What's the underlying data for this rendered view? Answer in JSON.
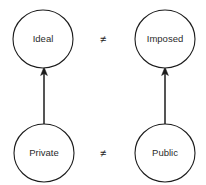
{
  "diagram": {
    "type": "node-edge-diagram",
    "background_color": "#ffffff",
    "stroke_color": "#1c1c1c",
    "text_color": "#2b2b2b",
    "nodes": [
      {
        "id": "ideal",
        "label": "Ideal",
        "cx": 43,
        "cy": 39,
        "rx": 30,
        "ry": 29
      },
      {
        "id": "imposed",
        "label": "Imposed",
        "cx": 165,
        "cy": 39,
        "rx": 30,
        "ry": 29
      },
      {
        "id": "private",
        "label": "Private",
        "cx": 44,
        "cy": 153,
        "rx": 30,
        "ry": 29
      },
      {
        "id": "public",
        "label": "Public",
        "cx": 165,
        "cy": 153,
        "rx": 30,
        "ry": 29
      }
    ],
    "edges": [
      {
        "id": "private-to-ideal",
        "from": "private",
        "to": "ideal",
        "arrow": "up",
        "x": 44,
        "y1": 124,
        "y2": 70
      },
      {
        "id": "public-to-imposed",
        "from": "public",
        "to": "imposed",
        "arrow": "up",
        "x": 165,
        "y1": 124,
        "y2": 70
      }
    ],
    "relations": [
      {
        "id": "relation-top",
        "symbol": "≠",
        "between": [
          "ideal",
          "imposed"
        ],
        "x": 103,
        "y": 39
      },
      {
        "id": "relation-bottom",
        "symbol": "≠",
        "between": [
          "private",
          "public"
        ],
        "x": 103,
        "y": 153
      }
    ]
  }
}
